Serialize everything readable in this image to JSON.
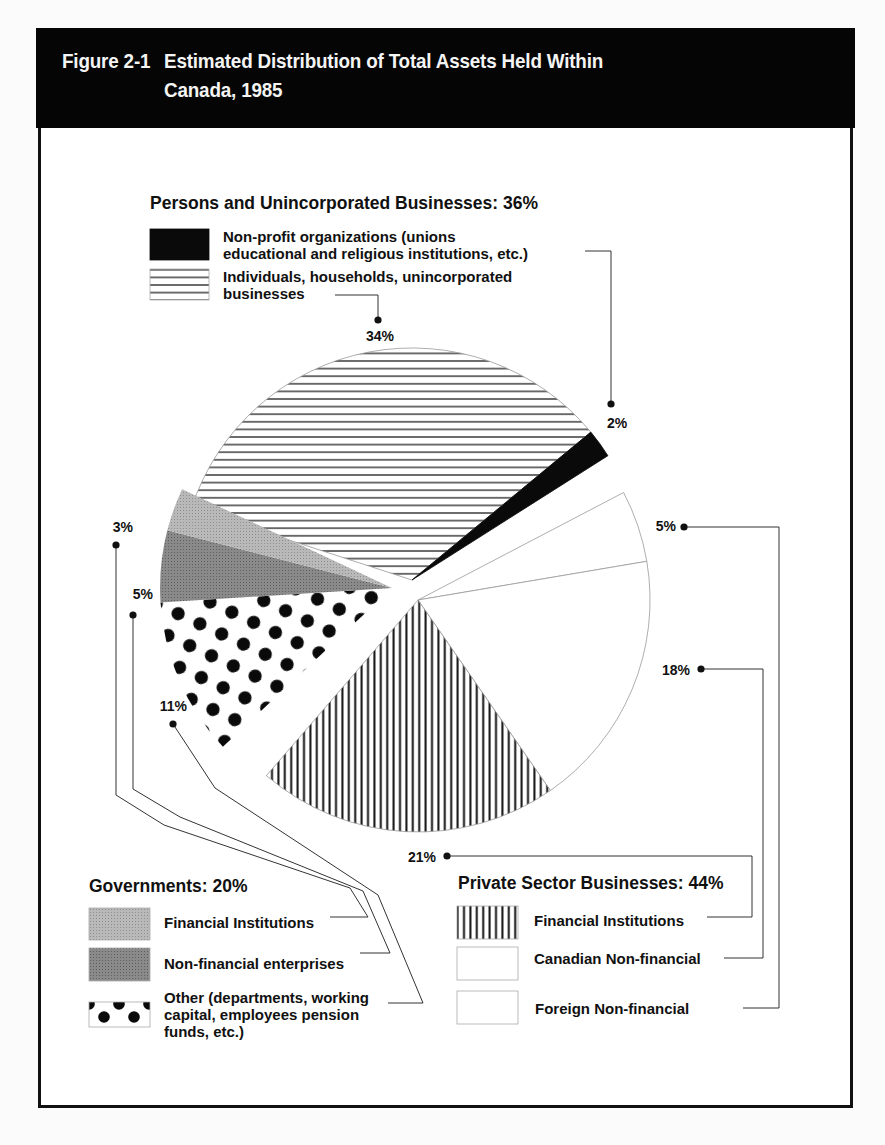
{
  "figure": {
    "number": "Figure 2-1",
    "title_line1": "Estimated Distribution of Total Assets Held Within",
    "title_line2": "Canada, 1985"
  },
  "chart_data": {
    "type": "pie",
    "unit": "%",
    "groups": [
      {
        "name": "Persons and Unincorporated Businesses",
        "total": 36,
        "title_label": "Persons and Unincorporated Businesses: 36%",
        "slices": [
          {
            "key": "individuals",
            "label": "Individuals, households, unincorporated businesses",
            "label_lines": [
              "Individuals, households, unincorporated",
              "businesses"
            ],
            "value": 34,
            "value_label": "34%",
            "pattern": "horizontal-lines"
          },
          {
            "key": "nonprofit",
            "label": "Non-profit organizations (unions educational and religious institutions, etc.)",
            "label_lines": [
              "Non-profit organizations (unions",
              "educational and religious institutions, etc.)"
            ],
            "value": 2,
            "value_label": "2%",
            "pattern": "solid-black"
          }
        ]
      },
      {
        "name": "Private Sector Businesses",
        "total": 44,
        "title_label": "Private Sector Businesses: 44%",
        "slices": [
          {
            "key": "foreign",
            "label": "Foreign Non-financial",
            "label_lines": [
              "Foreign Non-financial"
            ],
            "value": 5,
            "value_label": "5%",
            "pattern": "white"
          },
          {
            "key": "canadian",
            "label": "Canadian Non-financial",
            "label_lines": [
              "Canadian Non-financial"
            ],
            "value": 18,
            "value_label": "18%",
            "pattern": "white"
          },
          {
            "key": "private_fin",
            "label": "Financial Institutions",
            "label_lines": [
              "Financial Institutions"
            ],
            "value": 21,
            "value_label": "21%",
            "pattern": "vertical-lines"
          }
        ]
      },
      {
        "name": "Governments",
        "total": 20,
        "title_label": "Governments: 20%",
        "slices": [
          {
            "key": "gov_other",
            "label": "Other (departments, working capital, employees pension funds, etc.)",
            "label_lines": [
              "Other (departments, working",
              "capital, employees pension",
              "funds, etc.)"
            ],
            "value": 11,
            "value_label": "11%",
            "pattern": "polka-dots"
          },
          {
            "key": "gov_nonfin",
            "label": "Non-financial enterprises",
            "label_lines": [
              "Non-financial enterprises"
            ],
            "value": 5,
            "value_label": "5%",
            "pattern": "dark-gray"
          },
          {
            "key": "gov_fin",
            "label": "Financial Institutions",
            "label_lines": [
              "Financial Institutions"
            ],
            "value": 3,
            "value_label": "3%",
            "pattern": "light-gray"
          }
        ]
      }
    ],
    "legend_placement": "top-left (Persons), bottom-left (Governments), bottom-right (Private Sector)",
    "colors": {
      "ink": "#111111",
      "light_gray": "#b8b8b8",
      "dark_gray": "#8a8a8a",
      "paper": "#ffffff",
      "header_bg": "#050505"
    }
  }
}
